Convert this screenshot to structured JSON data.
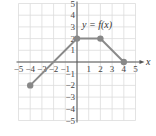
{
  "chart_data": {
    "type": "line",
    "title": "",
    "xlabel": "x",
    "ylabel": "",
    "annotation": "y = f(x)",
    "xlim": [
      -5,
      5
    ],
    "ylim": [
      -5,
      5
    ],
    "grid": true,
    "x_ticks": [
      "-5",
      "-4",
      "-3",
      "-2",
      "-1",
      "1",
      "2",
      "3",
      "4",
      "5"
    ],
    "y_ticks": [
      "5",
      "4",
      "3",
      "2",
      "1",
      "-1",
      "-2",
      "-3",
      "-4",
      "-5"
    ],
    "series": [
      {
        "name": "f(x)",
        "points": [
          [
            -4,
            -2
          ],
          [
            0,
            2
          ],
          [
            2,
            2
          ],
          [
            4,
            0
          ]
        ],
        "markers": true
      }
    ],
    "colors": {
      "line": "#8a8a8a",
      "grid": "#dcdcdc",
      "axis": "#555555",
      "marker": "#888888"
    }
  }
}
